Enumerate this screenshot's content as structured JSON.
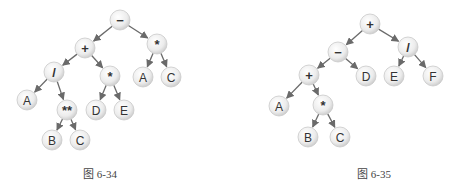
{
  "figures": [
    {
      "id": "fig-6-34",
      "caption": "图 6-34",
      "nodes": [
        {
          "id": "n1",
          "label": "−"
        },
        {
          "id": "n2",
          "label": "+"
        },
        {
          "id": "n3",
          "label": "*"
        },
        {
          "id": "n4",
          "label": "/"
        },
        {
          "id": "n5",
          "label": "*"
        },
        {
          "id": "n6",
          "label": "A"
        },
        {
          "id": "n7",
          "label": "C"
        },
        {
          "id": "n8",
          "label": "A"
        },
        {
          "id": "n9",
          "label": "**"
        },
        {
          "id": "n10",
          "label": "D"
        },
        {
          "id": "n11",
          "label": "E"
        },
        {
          "id": "n12",
          "label": "B"
        },
        {
          "id": "n13",
          "label": "C"
        }
      ],
      "edges": [
        [
          "n1",
          "n2"
        ],
        [
          "n1",
          "n3"
        ],
        [
          "n2",
          "n4"
        ],
        [
          "n2",
          "n5"
        ],
        [
          "n3",
          "n6"
        ],
        [
          "n3",
          "n7"
        ],
        [
          "n4",
          "n8"
        ],
        [
          "n4",
          "n9"
        ],
        [
          "n5",
          "n10"
        ],
        [
          "n5",
          "n11"
        ],
        [
          "n9",
          "n12"
        ],
        [
          "n9",
          "n13"
        ]
      ]
    },
    {
      "id": "fig-6-35",
      "caption": "图 6-35",
      "nodes": [
        {
          "id": "m1",
          "label": "+"
        },
        {
          "id": "m2",
          "label": "−"
        },
        {
          "id": "m3",
          "label": "/"
        },
        {
          "id": "m4",
          "label": "+"
        },
        {
          "id": "m5",
          "label": "D"
        },
        {
          "id": "m6",
          "label": "E"
        },
        {
          "id": "m7",
          "label": "F"
        },
        {
          "id": "m8",
          "label": "A"
        },
        {
          "id": "m9",
          "label": "*"
        },
        {
          "id": "m10",
          "label": "B"
        },
        {
          "id": "m11",
          "label": "C"
        }
      ],
      "edges": [
        [
          "m1",
          "m2"
        ],
        [
          "m1",
          "m3"
        ],
        [
          "m2",
          "m4"
        ],
        [
          "m2",
          "m5"
        ],
        [
          "m3",
          "m6"
        ],
        [
          "m3",
          "m7"
        ],
        [
          "m4",
          "m8"
        ],
        [
          "m4",
          "m9"
        ],
        [
          "m9",
          "m10"
        ],
        [
          "m9",
          "m11"
        ]
      ]
    }
  ]
}
